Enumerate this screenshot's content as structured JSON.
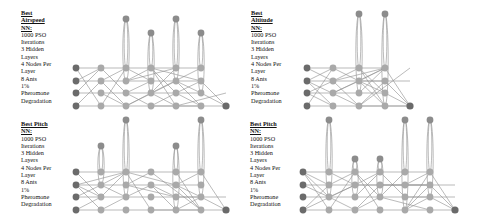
{
  "colors": {
    "input": "#6b6b6b",
    "hidden_light": "#a9a9a9",
    "hidden_mid": "#8c8c8c",
    "output": "#6a6a6a",
    "edge": "#7a7a7a"
  },
  "panels": [
    {
      "id": "airspeed",
      "title": "Best Airspeed NN:",
      "lines": [
        "1000 PSO Iterations",
        "3 Hidden Layers",
        "4 Nodes Per Layer",
        "8 Ants",
        "1% Pheromone Degradation"
      ],
      "caption_pos": [
        21,
        9
      ],
      "layers_x": [
        76,
        101,
        126,
        151,
        176,
        201,
        226
      ],
      "rows_y": [
        68,
        81,
        93,
        106
      ],
      "top_nodes": [
        [
          126,
          19
        ],
        [
          151,
          33
        ],
        [
          176,
          19
        ],
        [
          201,
          33
        ]
      ],
      "output": [
        226,
        106
      ]
    },
    {
      "id": "altitude",
      "title": "Best Altitude NN:",
      "lines": [
        "1000 PSO Iterations",
        "3 Hidden Layers",
        "4 Nodes Per Layer",
        "8 Ants",
        "1% Pheromone Degradation"
      ],
      "caption_pos": [
        251,
        9
      ],
      "layers_x": [
        307,
        333,
        359,
        385,
        410
      ],
      "rows_y": [
        68,
        81,
        93,
        106
      ],
      "top_nodes": [
        [
          359,
          14
        ],
        [
          385,
          14
        ]
      ],
      "output": [
        410,
        106
      ]
    },
    {
      "id": "pitch",
      "title": "Best Pitch NN:",
      "lines": [
        "1000 PSO Iterations",
        "3 Hidden Layers",
        "4 Nodes Per Layer",
        "8 Ants",
        "1% Pheromone Degradation"
      ],
      "caption_pos": [
        21,
        120
      ],
      "layers_x": [
        76,
        101,
        126,
        151,
        176,
        201,
        226
      ],
      "rows_y": [
        172,
        185,
        197,
        210
      ],
      "top_nodes": [
        [
          101,
          146
        ],
        [
          126,
          120
        ],
        [
          176,
          146
        ],
        [
          201,
          120
        ]
      ],
      "output": [
        226,
        210
      ]
    },
    {
      "id": "pitch2",
      "title": "Best Pitch NN:",
      "lines": [
        "1000 PSO Iterations",
        "3 Hidden Layers",
        "4 Nodes Per Layer",
        "8 Ants",
        "1% Pheromone Degradation"
      ],
      "caption_pos": [
        250,
        120
      ],
      "layers_x": [
        303,
        329,
        355,
        380,
        405,
        430,
        455
      ],
      "rows_y": [
        172,
        185,
        197,
        210
      ],
      "top_nodes": [
        [
          329,
          120
        ],
        [
          355,
          159
        ],
        [
          380,
          159
        ],
        [
          405,
          120
        ],
        [
          430,
          120
        ]
      ],
      "output": [
        455,
        210
      ]
    }
  ]
}
